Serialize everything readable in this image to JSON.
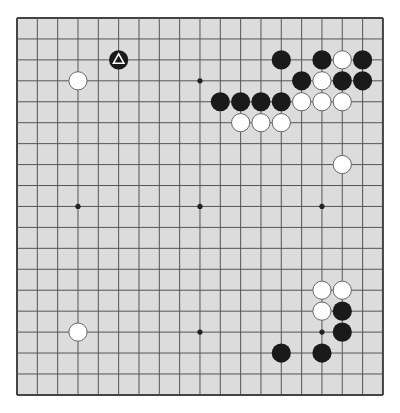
{
  "board": {
    "size": 19,
    "origin_x": 17,
    "origin_y": 18,
    "spacing_x": 20.33,
    "spacing_y": 20.94,
    "background": "#dcdcdc",
    "line_color": "#555555",
    "border_color": "#444444",
    "star_points": [
      [
        3,
        3
      ],
      [
        9,
        3
      ],
      [
        15,
        3
      ],
      [
        3,
        9
      ],
      [
        9,
        9
      ],
      [
        15,
        9
      ],
      [
        3,
        15
      ],
      [
        9,
        15
      ],
      [
        15,
        15
      ]
    ]
  },
  "stones": [
    {
      "color": "black",
      "col": 5,
      "row": 2,
      "marker": "triangle"
    },
    {
      "color": "white",
      "col": 3,
      "row": 3
    },
    {
      "color": "black",
      "col": 13,
      "row": 2
    },
    {
      "color": "black",
      "col": 15,
      "row": 2
    },
    {
      "color": "white",
      "col": 16,
      "row": 2
    },
    {
      "color": "black",
      "col": 17,
      "row": 2
    },
    {
      "color": "black",
      "col": 14,
      "row": 3
    },
    {
      "color": "white",
      "col": 15,
      "row": 3
    },
    {
      "color": "black",
      "col": 16,
      "row": 3
    },
    {
      "color": "black",
      "col": 17,
      "row": 3
    },
    {
      "color": "black",
      "col": 10,
      "row": 4
    },
    {
      "color": "black",
      "col": 11,
      "row": 4
    },
    {
      "color": "black",
      "col": 12,
      "row": 4
    },
    {
      "color": "black",
      "col": 13,
      "row": 4
    },
    {
      "color": "white",
      "col": 14,
      "row": 4
    },
    {
      "color": "white",
      "col": 15,
      "row": 4
    },
    {
      "color": "white",
      "col": 16,
      "row": 4
    },
    {
      "color": "white",
      "col": 11,
      "row": 5
    },
    {
      "color": "white",
      "col": 12,
      "row": 5
    },
    {
      "color": "white",
      "col": 13,
      "row": 5
    },
    {
      "color": "white",
      "col": 16,
      "row": 7
    },
    {
      "color": "white",
      "col": 15,
      "row": 13
    },
    {
      "color": "white",
      "col": 16,
      "row": 13
    },
    {
      "color": "white",
      "col": 15,
      "row": 14
    },
    {
      "color": "black",
      "col": 16,
      "row": 14
    },
    {
      "color": "black",
      "col": 16,
      "row": 15
    },
    {
      "color": "white",
      "col": 3,
      "row": 15
    },
    {
      "color": "black",
      "col": 13,
      "row": 16
    },
    {
      "color": "black",
      "col": 15,
      "row": 16
    }
  ],
  "colors": {
    "black_stone": "#1a1a1a",
    "white_stone": "#ffffff",
    "white_stone_edge": "#666666",
    "marker": "#ffffff"
  }
}
